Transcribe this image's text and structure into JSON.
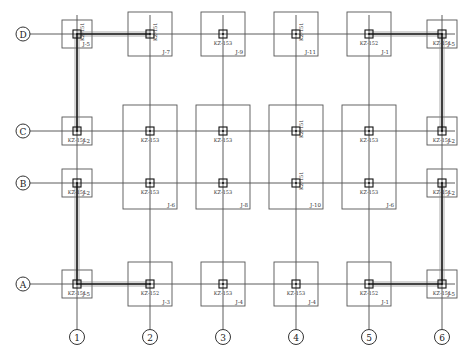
{
  "axes": {
    "columns": [
      "1",
      "2",
      "3",
      "4",
      "5",
      "6"
    ],
    "rows": [
      "D",
      "C",
      "B",
      "A"
    ]
  },
  "footings": [
    {
      "row": "D",
      "col": "1",
      "column_label": "KZ-151",
      "footing_label": "J-5",
      "label_vertical": true,
      "size": "small"
    },
    {
      "row": "D",
      "col": "2",
      "column_label": "KZ-151",
      "footing_label": "J-7",
      "label_vertical": true,
      "size": "medium"
    },
    {
      "row": "D",
      "col": "3",
      "column_label": "KZ-153",
      "footing_label": "J-9",
      "label_vertical": false,
      "size": "medium"
    },
    {
      "row": "D",
      "col": "4",
      "column_label": "KZ-151",
      "footing_label": "J-11",
      "label_vertical": true,
      "size": "medium"
    },
    {
      "row": "D",
      "col": "5",
      "column_label": "KZ-152",
      "footing_label": "J-1",
      "label_vertical": false,
      "size": "medium"
    },
    {
      "row": "D",
      "col": "6",
      "column_label": "KZ-151",
      "footing_label": "J-5",
      "label_vertical": false,
      "size": "small"
    },
    {
      "row": "C",
      "col": "1",
      "column_label": "KZ-151",
      "footing_label": "J-2",
      "label_vertical": false,
      "size": "small"
    },
    {
      "row": "C",
      "col": "6",
      "column_label": "KZ-151",
      "footing_label": "J-2",
      "label_vertical": false,
      "size": "small"
    },
    {
      "row": "B",
      "col": "1",
      "column_label": "KZ-151",
      "footing_label": "J-2",
      "label_vertical": false,
      "size": "small"
    },
    {
      "row": "B",
      "col": "6",
      "column_label": "KZ-151",
      "footing_label": "J-2",
      "label_vertical": false,
      "size": "small"
    },
    {
      "row": "A",
      "col": "1",
      "column_label": "KZ-151",
      "footing_label": "J-5",
      "label_vertical": false,
      "size": "small"
    },
    {
      "row": "A",
      "col": "2",
      "column_label": "KZ-152",
      "footing_label": "J-3",
      "label_vertical": false,
      "size": "medium"
    },
    {
      "row": "A",
      "col": "3",
      "column_label": "KZ-153",
      "footing_label": "J-4",
      "label_vertical": false,
      "size": "medium"
    },
    {
      "row": "A",
      "col": "4",
      "column_label": "KZ-153",
      "footing_label": "J-4",
      "label_vertical": false,
      "size": "medium"
    },
    {
      "row": "A",
      "col": "5",
      "column_label": "KZ-152",
      "footing_label": "J-1",
      "label_vertical": false,
      "size": "medium"
    },
    {
      "row": "A",
      "col": "6",
      "column_label": "KZ-151",
      "footing_label": "J-5",
      "label_vertical": false,
      "size": "small"
    }
  ],
  "combined_footings": [
    {
      "col": "2",
      "rows": [
        "C",
        "B"
      ],
      "column_labels": [
        "KZ-153",
        "KZ-153"
      ],
      "footing_label": "J-6",
      "label_vertical": false
    },
    {
      "col": "3",
      "rows": [
        "C",
        "B"
      ],
      "column_labels": [
        "KZ-153",
        "KZ-153"
      ],
      "footing_label": "J-8",
      "label_vertical": false
    },
    {
      "col": "4",
      "rows": [
        "C",
        "B"
      ],
      "column_labels": [
        "KZ-151",
        "KZ-151"
      ],
      "footing_label": "J-10",
      "label_vertical": true
    },
    {
      "col": "5",
      "rows": [
        "C",
        "B"
      ],
      "column_labels": [
        "KZ-153",
        "KZ-153"
      ],
      "footing_label": "J-6",
      "label_vertical": false
    }
  ],
  "tie_beams": [
    {
      "from": [
        "D",
        "1"
      ],
      "to": [
        "D",
        "2"
      ]
    },
    {
      "from": [
        "D",
        "5"
      ],
      "to": [
        "D",
        "6"
      ]
    },
    {
      "from": [
        "D",
        "1"
      ],
      "to": [
        "C",
        "1"
      ]
    },
    {
      "from": [
        "D",
        "6"
      ],
      "to": [
        "C",
        "6"
      ]
    },
    {
      "from": [
        "B",
        "1"
      ],
      "to": [
        "A",
        "1"
      ]
    },
    {
      "from": [
        "B",
        "6"
      ],
      "to": [
        "A",
        "6"
      ]
    },
    {
      "from": [
        "A",
        "1"
      ],
      "to": [
        "A",
        "2"
      ]
    },
    {
      "from": [
        "A",
        "5"
      ],
      "to": [
        "A",
        "6"
      ]
    }
  ]
}
